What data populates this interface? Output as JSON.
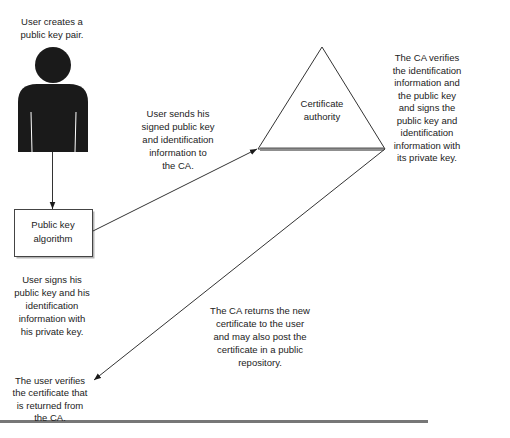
{
  "nodes": {
    "user": {
      "icon": "person-icon",
      "caption": [
        "User creates a",
        "public key pair."
      ]
    },
    "algorithm_box": {
      "label": [
        "Public key",
        "algorithm"
      ]
    },
    "certificate_authority": {
      "shape": "triangle",
      "label": [
        "Certificate",
        "authority"
      ]
    }
  },
  "annotations": {
    "user_signs": [
      "User signs his",
      "public key and his",
      "identification",
      "information with",
      "his private key."
    ],
    "user_sends": [
      "User sends his",
      "signed public key",
      "and identification",
      "information to",
      "the CA."
    ],
    "ca_verifies": [
      "The CA verifies",
      "the identification",
      "information and",
      "the public key",
      "and signs the",
      "public key and",
      "identification",
      "information with",
      "its private key."
    ],
    "ca_returns": [
      "The CA returns the new",
      "certificate to the user",
      "and may also post the",
      "certificate in a public",
      "repository."
    ],
    "user_verifies": [
      "The user verifies",
      "the certificate that",
      "is returned from",
      "the CA."
    ]
  },
  "edges": [
    {
      "from": "user",
      "to": "algorithm_box"
    },
    {
      "from": "algorithm_box",
      "to": "certificate_authority"
    },
    {
      "from": "certificate_authority",
      "to": "user_verifies"
    }
  ],
  "colors": {
    "text": "#222222",
    "line": "#333333",
    "figure": "#1a1a1a",
    "rule": "#777777"
  }
}
